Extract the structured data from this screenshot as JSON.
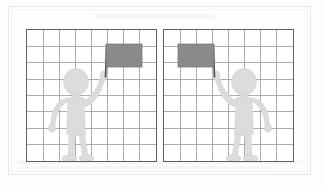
{
  "image": {
    "kind": "spatial-reasoning-figure",
    "description": "Two square grids side by side, each containing a light gray stick figure holding a dark gray rectangular flag on a thin pole; the right panel is the mirror image of the left panel.",
    "background_color": "#fdfdfd",
    "outer_frame_color": "#e8e8e8"
  },
  "panels": [
    {
      "id": "left-panel",
      "name": "left-grid-panel",
      "border_color": "#5e5e5e",
      "fill_color": "#ffffff",
      "grid": {
        "columns": 8,
        "rows": 8,
        "line_color": "#9a9a9a",
        "line_width": 0.8,
        "cell_size": 16.25
      },
      "figure": {
        "name": "stick-figure",
        "fill_color": "#dcdcdc",
        "stroke_color": "#cfcfcf",
        "orientation": "facing-viewer",
        "raised_arm": "left-arm-of-figure",
        "position": "center-left"
      },
      "flag": {
        "name": "flag-banner",
        "fill_color": "#8a8a8a",
        "stroke_color": "#6e6e6e",
        "width_cells": 2.2,
        "height_cells": 1.4,
        "position": "upper-right"
      },
      "pole": {
        "name": "flag-pole",
        "color": "#4a4a4a",
        "width": 1.6,
        "position": "upper-right"
      }
    },
    {
      "id": "right-panel",
      "name": "right-grid-panel",
      "border_color": "#5e5e5e",
      "fill_color": "#ffffff",
      "grid": {
        "columns": 8,
        "rows": 8,
        "line_color": "#9a9a9a",
        "line_width": 0.8,
        "cell_size": 16.25
      },
      "figure": {
        "name": "stick-figure",
        "fill_color": "#dcdcdc",
        "stroke_color": "#cfcfcf",
        "orientation": "facing-viewer-mirrored",
        "raised_arm": "right-arm-of-figure",
        "position": "center-right"
      },
      "flag": {
        "name": "flag-banner",
        "fill_color": "#8a8a8a",
        "stroke_color": "#6e6e6e",
        "width_cells": 2.2,
        "height_cells": 1.4,
        "position": "upper-left"
      },
      "pole": {
        "name": "flag-pole",
        "color": "#4a4a4a",
        "width": 1.6,
        "position": "upper-left"
      }
    }
  ]
}
